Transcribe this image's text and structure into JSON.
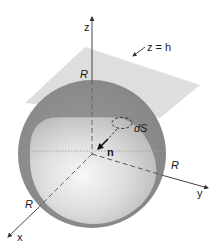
{
  "diagram": {
    "labels": {
      "z_axis": "z",
      "x_axis": "x",
      "y_axis": "y",
      "plane": "z = h",
      "radius_top": "R",
      "radius_right": "R",
      "radius_left": "R",
      "surface_element": "dS",
      "normal": "n"
    },
    "colors": {
      "background": "#ffffff",
      "plane": "#d9d9d9",
      "sphere_outer": "#8c8c8c",
      "sphere_inner_light": "#f4f4f4",
      "sphere_inner_mid": "#c4c4c4",
      "axis": "#333333",
      "text": "#1a1a1a"
    },
    "geometry": {
      "origin": [
        92,
        154
      ],
      "sphere_radius_px": 74,
      "plane_corners": [
        [
          25,
          103
        ],
        [
          85,
          47
        ],
        [
          200,
          85
        ],
        [
          165,
          115
        ]
      ]
    }
  }
}
